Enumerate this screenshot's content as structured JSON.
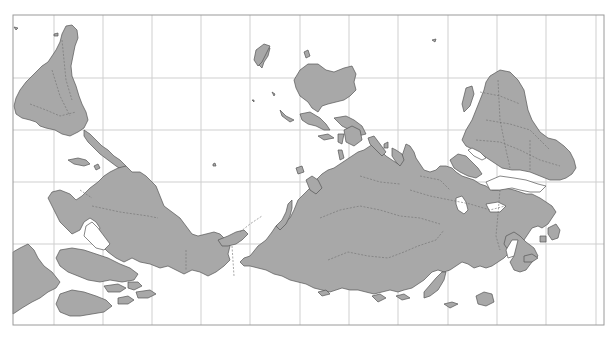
{
  "map": {
    "title": "South-up world map (Plate Carrée, rotated 180°)",
    "projection": "equirectangular",
    "orientation": "south-up",
    "frame": {
      "left": 13,
      "top": 15,
      "right": 604,
      "bottom": 325
    },
    "graticule": {
      "vertical_x": [
        54,
        103,
        152,
        201,
        250,
        300,
        349,
        398,
        448,
        497,
        546,
        596
      ],
      "horizontal_y": [
        78,
        130,
        182,
        244
      ]
    },
    "colors": {
      "background": "#ffffff",
      "land": "#a8a8a8",
      "coast": "#555555",
      "country_border": "#6e6e6e",
      "grid": "#cfcfcf",
      "frame": "#9a9a9a"
    },
    "regions": [
      {
        "name": "South America",
        "label": "South America"
      },
      {
        "name": "North America",
        "label": "North America"
      },
      {
        "name": "Greenland",
        "label": "Greenland"
      },
      {
        "name": "Eurasia",
        "label": "Eurasia"
      },
      {
        "name": "Africa",
        "label": "Africa"
      },
      {
        "name": "Australia",
        "label": "Australia"
      },
      {
        "name": "Madagascar",
        "label": "Madagascar"
      },
      {
        "name": "Indonesia",
        "label": "Indonesia"
      },
      {
        "name": "Antarctic Peninsula",
        "label": "Antarctic Peninsula"
      },
      {
        "name": "Arabian Peninsula",
        "label": "Arabian Peninsula"
      },
      {
        "name": "Canadian Arctic Archipelago",
        "label": "Canadian Arctic Archipelago"
      },
      {
        "name": "New Zealand",
        "label": "New Zealand"
      }
    ]
  }
}
